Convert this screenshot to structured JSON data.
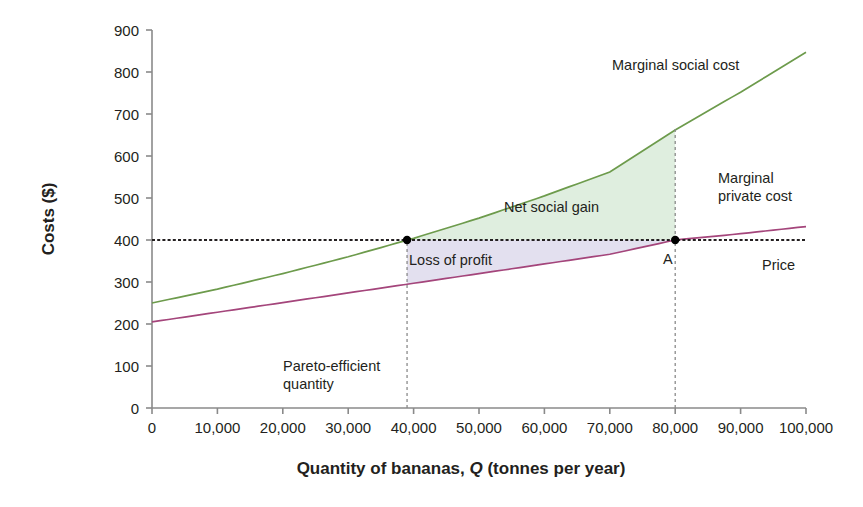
{
  "chart_data": {
    "type": "line",
    "title": "",
    "xlabel": "Quantity of bananas, Q (tonnes per year)",
    "ylabel": "Costs ($)",
    "xlim": [
      0,
      100000
    ],
    "ylim": [
      0,
      900
    ],
    "grid": false,
    "legend_position": "inline-annotations",
    "x_ticks": [
      "0",
      "10,000",
      "20,000",
      "30,000",
      "40,000",
      "50,000",
      "60,000",
      "70,000",
      "80,000",
      "90,000",
      "100,000"
    ],
    "x_tick_values": [
      0,
      10000,
      20000,
      30000,
      40000,
      50000,
      60000,
      70000,
      80000,
      90000,
      100000
    ],
    "y_ticks": [
      "0",
      "100",
      "200",
      "300",
      "400",
      "500",
      "600",
      "700",
      "800",
      "900"
    ],
    "y_tick_values": [
      0,
      100,
      200,
      300,
      400,
      500,
      600,
      700,
      800,
      900
    ],
    "series": [
      {
        "name": "Marginal social cost",
        "color": "#6d9b4c",
        "style": "solid",
        "x": [
          0,
          10000,
          20000,
          30000,
          40000,
          50000,
          60000,
          70000,
          80000,
          90000,
          100000
        ],
        "values": [
          250,
          283,
          320,
          360,
          404,
          452,
          505,
          562,
          662,
          752,
          847
        ]
      },
      {
        "name": "Marginal private cost",
        "color": "#a4457b",
        "style": "solid",
        "x": [
          0,
          10000,
          20000,
          30000,
          40000,
          50000,
          60000,
          70000,
          80000,
          90000,
          100000
        ],
        "values": [
          205,
          228,
          251,
          274,
          297,
          320,
          343,
          366,
          400,
          415,
          432
        ]
      },
      {
        "name": "Price",
        "color": "#231f20",
        "style": "dashed",
        "x": [
          0,
          100000
        ],
        "values": [
          400,
          400
        ]
      }
    ],
    "regions": [
      {
        "name": "Net social gain",
        "fill": "#dfeedf",
        "description": "Area between marginal social cost and price from 39,000 to 80,000"
      },
      {
        "name": "Loss of profit",
        "fill": "#e3e0ef",
        "description": "Area between price and marginal private cost from 39,000 to 80,000"
      }
    ],
    "points": [
      {
        "name": "pareto-efficient-point",
        "label": "",
        "x": 39000,
        "y": 400
      },
      {
        "name": "point-a",
        "label": "A",
        "x": 80000,
        "y": 400
      }
    ],
    "vertical_markers": [
      {
        "name": "pareto-efficient-line",
        "x": 39000,
        "y_from": 0,
        "y_to": 400
      },
      {
        "name": "market-quantity-line",
        "x": 80000,
        "y_from": 0,
        "y_to": 665
      }
    ],
    "annotations": [
      {
        "name": "marginal-social-cost-label",
        "text": "Marginal social cost",
        "x_px": 612,
        "y_px": 70,
        "anchor": "start",
        "lines": [
          "Marginal social cost"
        ]
      },
      {
        "name": "marginal-private-cost-label",
        "text": "Marginal private cost",
        "x_px": 718,
        "y_px": 183,
        "anchor": "start",
        "lines": [
          "Marginal",
          "private cost"
        ]
      },
      {
        "name": "price-label",
        "text": "Price",
        "x_px": 762,
        "y_px": 270,
        "anchor": "start",
        "lines": [
          "Price"
        ]
      },
      {
        "name": "net-social-gain-label",
        "text": "Net social gain",
        "x_px": 504,
        "y_px": 212,
        "anchor": "start",
        "lines": [
          "Net social gain"
        ]
      },
      {
        "name": "loss-of-profit-label",
        "text": "Loss of profit",
        "x_px": 409,
        "y_px": 265,
        "anchor": "start",
        "lines": [
          "Loss of profit"
        ]
      },
      {
        "name": "pareto-efficient-quantity-label",
        "text": "Pareto-efficient quantity",
        "x_px": 283,
        "y_px": 371,
        "anchor": "start",
        "lines": [
          "Pareto-efficient",
          "quantity"
        ]
      },
      {
        "name": "point-a-label",
        "text": "A",
        "x_px": 663,
        "y_px": 264,
        "anchor": "start",
        "lines": [
          "A"
        ]
      }
    ]
  },
  "axis": {
    "x_label_text": "Quantity of bananas, ",
    "x_label_italic": "Q",
    "x_label_tail": " (tonnes per year)",
    "y_label_text": "Costs ($)"
  }
}
